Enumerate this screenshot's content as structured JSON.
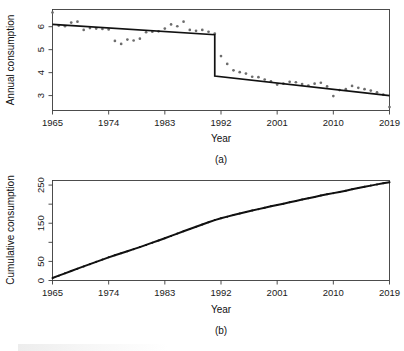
{
  "figure": {
    "background": "#ffffff",
    "point_color": "#6d6d6d",
    "line_color": "#111111",
    "axis_color": "#3a3a3a"
  },
  "chart_data": [
    {
      "type": "scatter",
      "panel": "a",
      "panel_label": "(a)",
      "title": "",
      "xlabel": "Year",
      "ylabel": "Annual consumption",
      "xlim": [
        1965,
        2019
      ],
      "ylim": [
        2.35,
        6.75
      ],
      "xticks": [
        1965,
        1974,
        1983,
        1992,
        2001,
        2010,
        2019
      ],
      "xticklabels": [
        "1965",
        "1974",
        "1983",
        "1992",
        "2001",
        "2010",
        "2019"
      ],
      "yticks": [
        3,
        4,
        5,
        6
      ],
      "yticklabels": [
        "3",
        "4",
        "5",
        "6"
      ],
      "grid": false,
      "legend": "none",
      "x": [
        1965,
        1966,
        1967,
        1968,
        1969,
        1970,
        1971,
        1972,
        1973,
        1974,
        1975,
        1976,
        1977,
        1978,
        1979,
        1980,
        1981,
        1982,
        1983,
        1984,
        1985,
        1986,
        1987,
        1988,
        1989,
        1990,
        1991,
        1992,
        1993,
        1994,
        1995,
        1996,
        1997,
        1998,
        1999,
        2000,
        2001,
        2002,
        2003,
        2004,
        2005,
        2006,
        2007,
        2008,
        2009,
        2010,
        2011,
        2012,
        2013,
        2014,
        2015,
        2016,
        2017,
        2018,
        2019
      ],
      "values": [
        6.62,
        6.05,
        6.02,
        6.18,
        6.22,
        5.86,
        5.94,
        5.92,
        5.9,
        5.88,
        5.38,
        5.25,
        5.44,
        5.4,
        5.48,
        5.76,
        5.78,
        5.8,
        5.92,
        6.1,
        6.02,
        6.22,
        5.86,
        5.82,
        5.86,
        5.78,
        5.7,
        4.72,
        4.38,
        4.1,
        4.02,
        3.96,
        3.82,
        3.8,
        3.7,
        3.62,
        3.48,
        3.52,
        3.6,
        3.58,
        3.5,
        3.44,
        3.52,
        3.56,
        3.4,
        2.98,
        3.24,
        3.28,
        3.42,
        3.34,
        3.28,
        3.22,
        3.14,
        3.04,
        2.5
      ],
      "annotations": [
        {
          "label": "fitted segmented regression with structural break",
          "break_year": 1991
        }
      ],
      "fit": {
        "type": "segmented-step",
        "segment1": {
          "x": [
            1965,
            1991
          ],
          "y": [
            6.1,
            5.65
          ]
        },
        "drop": {
          "x": 1991,
          "y_from": 5.65,
          "y_to": 3.85
        },
        "segment2": {
          "x": [
            1991,
            2019
          ],
          "y": [
            3.85,
            3.0
          ]
        }
      }
    },
    {
      "type": "line",
      "panel": "b",
      "panel_label": "(b)",
      "title": "",
      "xlabel": "Year",
      "ylabel": "Cumulative consumption",
      "xlim": [
        1965,
        2019
      ],
      "ylim": [
        0,
        262
      ],
      "xticks": [
        1965,
        1974,
        1983,
        1992,
        2001,
        2010,
        2019
      ],
      "xticklabels": [
        "1965",
        "1974",
        "1983",
        "1992",
        "2001",
        "2010",
        "2019"
      ],
      "yticks": [
        0,
        50,
        100,
        150,
        200,
        250
      ],
      "yticklabels": [
        "0",
        "50",
        "",
        "150",
        "",
        "250"
      ],
      "grid": false,
      "legend": "none",
      "x": [
        1965,
        1966,
        1967,
        1968,
        1969,
        1970,
        1971,
        1972,
        1973,
        1974,
        1975,
        1976,
        1977,
        1978,
        1979,
        1980,
        1981,
        1982,
        1983,
        1984,
        1985,
        1986,
        1987,
        1988,
        1989,
        1990,
        1991,
        1992,
        1993,
        1994,
        1995,
        1996,
        1997,
        1998,
        1999,
        2000,
        2001,
        2002,
        2003,
        2004,
        2005,
        2006,
        2007,
        2008,
        2009,
        2010,
        2011,
        2012,
        2013,
        2014,
        2015,
        2016,
        2017,
        2018,
        2019
      ],
      "values": [
        6.6,
        12.7,
        18.7,
        24.9,
        31.1,
        36.9,
        42.9,
        48.8,
        54.7,
        60.6,
        66.0,
        71.2,
        76.7,
        82.1,
        87.5,
        93.3,
        99.1,
        104.9,
        110.8,
        116.9,
        122.9,
        129.1,
        135.0,
        140.8,
        146.7,
        152.5,
        158.2,
        162.9,
        167.3,
        171.4,
        175.4,
        179.4,
        183.2,
        187.0,
        190.7,
        194.3,
        197.8,
        201.3,
        204.9,
        208.5,
        212.0,
        215.4,
        218.9,
        222.5,
        225.9,
        228.9,
        232.1,
        235.4,
        238.8,
        242.2,
        245.4,
        248.6,
        251.8,
        254.8,
        257.3
      ]
    }
  ]
}
